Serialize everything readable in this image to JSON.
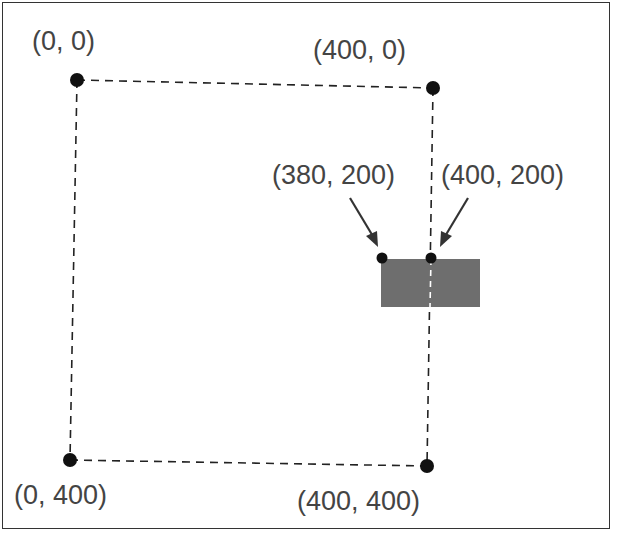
{
  "diagram": {
    "points": [
      {
        "label": "(0, 0)",
        "x": 77,
        "y": 80
      },
      {
        "label": "(400, 0)",
        "x": 433,
        "y": 88
      },
      {
        "label": "(0, 400)",
        "x": 70,
        "y": 460
      },
      {
        "label": "(400, 400)",
        "x": 427,
        "y": 466
      },
      {
        "label": "(380, 200)",
        "x": 382,
        "y": 258
      },
      {
        "label": "(400, 200)",
        "x": 431,
        "y": 258
      }
    ],
    "rectangle": {
      "x": 381,
      "y": 259,
      "width": 99,
      "height": 48,
      "color": "#6e6e6e"
    },
    "colors": {
      "points": "#111111",
      "lines": "#222222",
      "text": "#444444"
    }
  }
}
